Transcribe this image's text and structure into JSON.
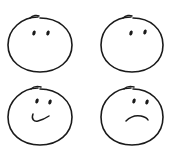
{
  "image": {
    "description": "Four hand-drawn face doodles arranged in a 2x2 grid",
    "background": "#ffffff",
    "ink_color": "#1a1a1a"
  },
  "faces": [
    {
      "position": "top-left",
      "expression": "neutral-no-mouth"
    },
    {
      "position": "top-right",
      "expression": "neutral-no-mouth"
    },
    {
      "position": "bottom-left",
      "expression": "smile"
    },
    {
      "position": "bottom-right",
      "expression": "frown"
    }
  ]
}
